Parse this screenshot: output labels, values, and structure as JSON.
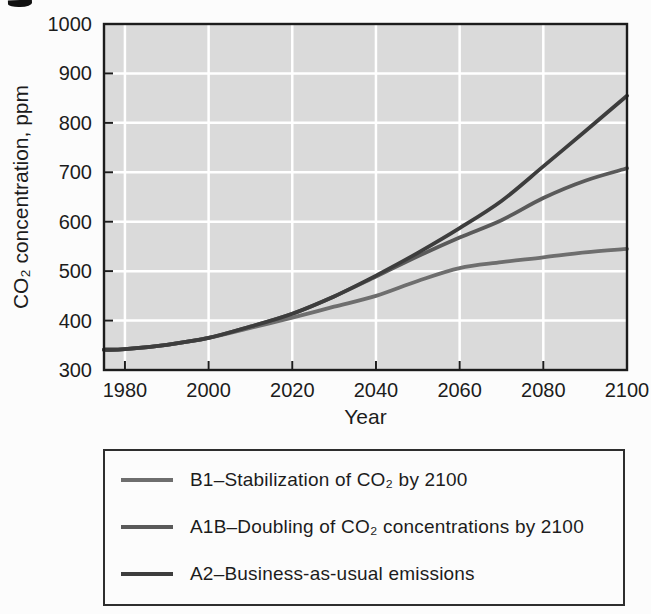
{
  "colors": {
    "page_bg": "#fcfcfc",
    "plot_bg": "#dadada",
    "grid": "#ffffff",
    "axis": "#1c1c1c",
    "text": "#1c1c1c",
    "legend_border": "#2e2e2e"
  },
  "chart_data": {
    "type": "line",
    "title": "",
    "xlabel": "Year",
    "ylabel": "CO₂ concentration, ppm",
    "xlim": [
      1975,
      2100
    ],
    "ylim": [
      300,
      1000
    ],
    "x_ticks": [
      1980,
      2000,
      2020,
      2040,
      2060,
      2080,
      2100
    ],
    "y_ticks": [
      300,
      400,
      500,
      600,
      700,
      800,
      900,
      1000
    ],
    "grid": "white gridlines on light-gray plot background",
    "legend_position": "boxed panel below chart",
    "x": [
      1975,
      1980,
      1990,
      2000,
      2010,
      2020,
      2030,
      2040,
      2050,
      2060,
      2070,
      2080,
      2090,
      2100
    ],
    "series": [
      {
        "name": "B1",
        "label": "B1–Stabilization of CO₂ by 2100",
        "color": "#6e6e6e",
        "values": [
          341,
          342,
          351,
          365,
          385,
          406,
          428,
          450,
          480,
          506,
          518,
          528,
          538,
          545
        ]
      },
      {
        "name": "A1B",
        "label": "A1B–Doubling of CO₂ concentrations by 2100",
        "color": "#5a5a5a",
        "values": [
          341,
          342,
          351,
          365,
          388,
          414,
          449,
          489,
          530,
          568,
          603,
          648,
          683,
          708
        ]
      },
      {
        "name": "A2",
        "label": "A2–Business-as-usual emissions",
        "color": "#3d3d3d",
        "values": [
          341,
          342,
          351,
          365,
          388,
          414,
          449,
          491,
          537,
          587,
          642,
          712,
          783,
          855
        ]
      }
    ]
  }
}
